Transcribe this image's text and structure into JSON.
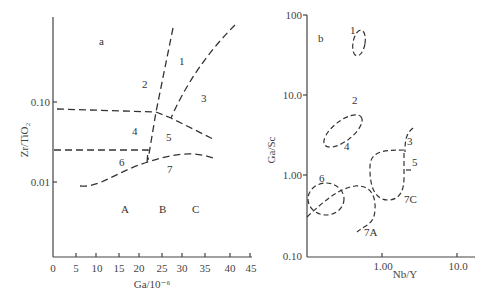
{
  "panel_a": {
    "label": "a",
    "x_axis_title": "Ga/10⁻⁶",
    "y_axis_title": "Zr/TiO₂",
    "x_ticks": [
      "0",
      "5",
      "10",
      "15",
      "20",
      "25",
      "30",
      "35",
      "40",
      "45"
    ],
    "y_ticks": [
      "0.10",
      "0.01"
    ],
    "regions": [
      "1",
      "2",
      "3",
      "4",
      "5",
      "6",
      "7"
    ],
    "zones": [
      "A",
      "B",
      "C"
    ]
  },
  "panel_b": {
    "label": "b",
    "x_axis_title": "Nb/Y",
    "y_axis_title": "Ga/Sc",
    "x_ticks": [
      "1.00",
      "10.0"
    ],
    "y_ticks": [
      "100",
      "10.0",
      "1.00",
      "0.10"
    ],
    "regions": [
      "1",
      "2",
      "3",
      "4",
      "5",
      "6",
      "7A",
      "7C"
    ]
  }
}
